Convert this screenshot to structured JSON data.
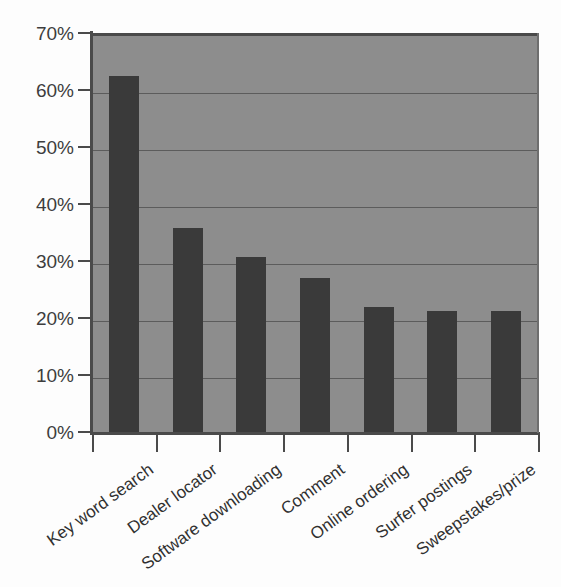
{
  "chart_data": {
    "type": "bar",
    "title": "",
    "subtitle": "",
    "xlabel": "",
    "ylabel": "",
    "categories": [
      "Key word search",
      "Dealer locator",
      "Software downloading",
      "Comment",
      "Online ordering",
      "Surfer postings",
      "Sweepstakes/prize"
    ],
    "values": [
      63,
      36.3,
      31.2,
      27.5,
      22.4,
      21.7,
      21.7
    ],
    "value_unit": "%",
    "ylim": [
      0,
      70
    ],
    "ytick_values": [
      0,
      10,
      20,
      30,
      40,
      50,
      60,
      70
    ],
    "ytick_labels": [
      "0%",
      "10%",
      "20%",
      "30%",
      "40%",
      "50%",
      "60%",
      "70%"
    ],
    "grid": true,
    "grid_axis": "y",
    "legend": false,
    "legend_position": "none",
    "series": [
      {
        "name": "Share of respondents",
        "values": [
          63,
          36.3,
          31.2,
          27.5,
          22.4,
          21.7,
          21.7
        ]
      }
    ],
    "annotations": []
  },
  "style": {
    "plot_background": "#8d8d8d",
    "figure_background": "#fdfdfd",
    "bar_color": "#3a3a3a",
    "gridline_color": "#5c5c5c",
    "axis_color": "#4a4a4a",
    "tick_label_color": "#3d3d3d",
    "category_label_color": "#303030",
    "category_label_rotation_deg": -36
  }
}
